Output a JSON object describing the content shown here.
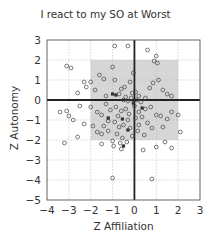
{
  "chart_data": {
    "type": "scatter",
    "title": "I react to my SO at Worst",
    "xlabel": "Z Affiliation",
    "ylabel": "Z Autonomy",
    "xlim": [
      -4,
      3
    ],
    "ylim": [
      -5,
      3
    ],
    "xticks": [
      -4,
      -3,
      -2,
      -1,
      0,
      1,
      2,
      3
    ],
    "yticks": [
      -5,
      -4,
      -3,
      -2,
      -1,
      0,
      1,
      2,
      3
    ],
    "xtick_labels": [
      "−4",
      "−3",
      "−2",
      "−1",
      "0",
      "1",
      "2",
      "3"
    ],
    "ytick_labels": [
      "−5",
      "−4",
      "−3",
      "−2",
      "−1",
      "0",
      "1",
      "2",
      "3"
    ],
    "grid": true,
    "grid_style": "dotted light gray",
    "zero_lines": true,
    "shaded_region": {
      "x": [
        -2,
        2
      ],
      "y": [
        -2,
        2
      ],
      "color": "#d6d6d6"
    },
    "legend": null,
    "marker": "open circle",
    "series": [
      {
        "name": "participants",
        "points": [
          [
            -0.9,
            2.7
          ],
          [
            -0.3,
            2.7
          ],
          [
            0.6,
            2.5
          ],
          [
            1.0,
            2.2
          ],
          [
            0.9,
            1.95
          ],
          [
            1.05,
            1.85
          ],
          [
            -1.0,
            1.65
          ],
          [
            -3.1,
            1.7
          ],
          [
            -2.9,
            1.6
          ],
          [
            -1.6,
            1.25
          ],
          [
            -1.4,
            1.05
          ],
          [
            -2.3,
            0.9
          ],
          [
            -2.0,
            0.9
          ],
          [
            -0.9,
            1.0
          ],
          [
            -0.2,
            0.9
          ],
          [
            -0.6,
            0.55
          ],
          [
            -2.6,
            0.35
          ],
          [
            -2.2,
            0.65
          ],
          [
            -1.3,
            0.2
          ],
          [
            -0.7,
            0.3
          ],
          [
            -0.4,
            0.15
          ],
          [
            -0.1,
            0.35
          ],
          [
            0.05,
            0.4
          ],
          [
            0.2,
            0.2
          ],
          [
            0.5,
            0.1
          ],
          [
            1.3,
            0.5
          ],
          [
            1.5,
            0.3
          ],
          [
            1.7,
            0.2
          ],
          [
            -0.5,
            0.0
          ],
          [
            -0.3,
            -0.05
          ],
          [
            -0.15,
            0.1
          ],
          [
            0.1,
            0.0
          ],
          [
            0.3,
            -0.1
          ],
          [
            -3.4,
            -0.6
          ],
          [
            -3.1,
            -0.55
          ],
          [
            -3.0,
            -0.8
          ],
          [
            -2.0,
            -0.35
          ],
          [
            -1.7,
            -0.6
          ],
          [
            -1.5,
            -0.75
          ],
          [
            -1.1,
            -0.5
          ],
          [
            -0.85,
            -0.35
          ],
          [
            -0.6,
            -0.55
          ],
          [
            -0.4,
            -0.45
          ],
          [
            -0.25,
            -0.7
          ],
          [
            0.0,
            -0.3
          ],
          [
            0.2,
            -0.6
          ],
          [
            0.5,
            -0.45
          ],
          [
            0.75,
            -0.35
          ],
          [
            1.0,
            -0.75
          ],
          [
            1.2,
            -0.8
          ],
          [
            1.5,
            -0.95
          ],
          [
            1.7,
            -0.6
          ],
          [
            2.0,
            -0.75
          ],
          [
            -2.8,
            -1.0
          ],
          [
            -2.3,
            -1.2
          ],
          [
            -1.9,
            -1.3
          ],
          [
            -1.2,
            -1.05
          ],
          [
            -0.9,
            -1.1
          ],
          [
            -0.7,
            -1.35
          ],
          [
            -0.5,
            -1.25
          ],
          [
            -0.2,
            -1.4
          ],
          [
            0.2,
            -1.25
          ],
          [
            0.6,
            -1.15
          ],
          [
            0.8,
            -1.4
          ],
          [
            2.1,
            -1.6
          ],
          [
            -1.7,
            -1.6
          ],
          [
            -1.5,
            -1.7
          ],
          [
            -1.2,
            -1.55
          ],
          [
            -0.8,
            -1.7
          ],
          [
            -0.55,
            -1.9
          ],
          [
            -0.1,
            -1.8
          ],
          [
            0.45,
            -1.75
          ],
          [
            -3.2,
            -2.15
          ],
          [
            -2.6,
            -1.85
          ],
          [
            -1.0,
            -2.05
          ],
          [
            -0.65,
            -2.15
          ],
          [
            -0.35,
            -2.1
          ],
          [
            -0.95,
            -2.3
          ],
          [
            -0.6,
            -2.45
          ],
          [
            1.4,
            -2.1
          ],
          [
            1.0,
            -2.35
          ],
          [
            1.7,
            -2.4
          ],
          [
            0.4,
            -2.5
          ],
          [
            -1.5,
            -2.2
          ],
          [
            -1.0,
            -3.9
          ],
          [
            0.8,
            -3.95
          ],
          [
            -0.3,
            -1.0
          ],
          [
            0.05,
            -0.9
          ],
          [
            0.35,
            -0.85
          ],
          [
            -1.3,
            -0.2
          ],
          [
            -1.8,
            0.5
          ],
          [
            0.7,
            0.6
          ],
          [
            1.1,
            1.0
          ],
          [
            -0.05,
            1.35
          ],
          [
            0.85,
            0.85
          ],
          [
            -0.75,
            -0.8
          ],
          [
            -1.4,
            -1.3
          ],
          [
            0.15,
            -1.55
          ],
          [
            1.3,
            -1.35
          ],
          [
            -2.5,
            -0.3
          ],
          [
            -0.45,
            0.65
          ]
        ],
        "filled_points": [
          [
            -1.0,
            0.3
          ],
          [
            -0.85,
            0.25
          ],
          [
            -0.55,
            -0.95
          ],
          [
            -0.3,
            -1.5
          ],
          [
            0.35,
            -0.4
          ],
          [
            -1.2,
            -0.9
          ],
          [
            -0.5,
            -2.3
          ],
          [
            -0.05,
            -0.15
          ]
        ]
      }
    ]
  }
}
